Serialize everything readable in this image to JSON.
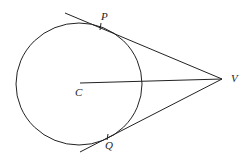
{
  "diagram": {
    "type": "geometry",
    "labels": {
      "center": "C",
      "tangent_point_top": "P",
      "tangent_point_bottom": "Q",
      "external_point": "V"
    },
    "colors": {
      "stroke": "#222222",
      "background": "#ffffff"
    }
  }
}
